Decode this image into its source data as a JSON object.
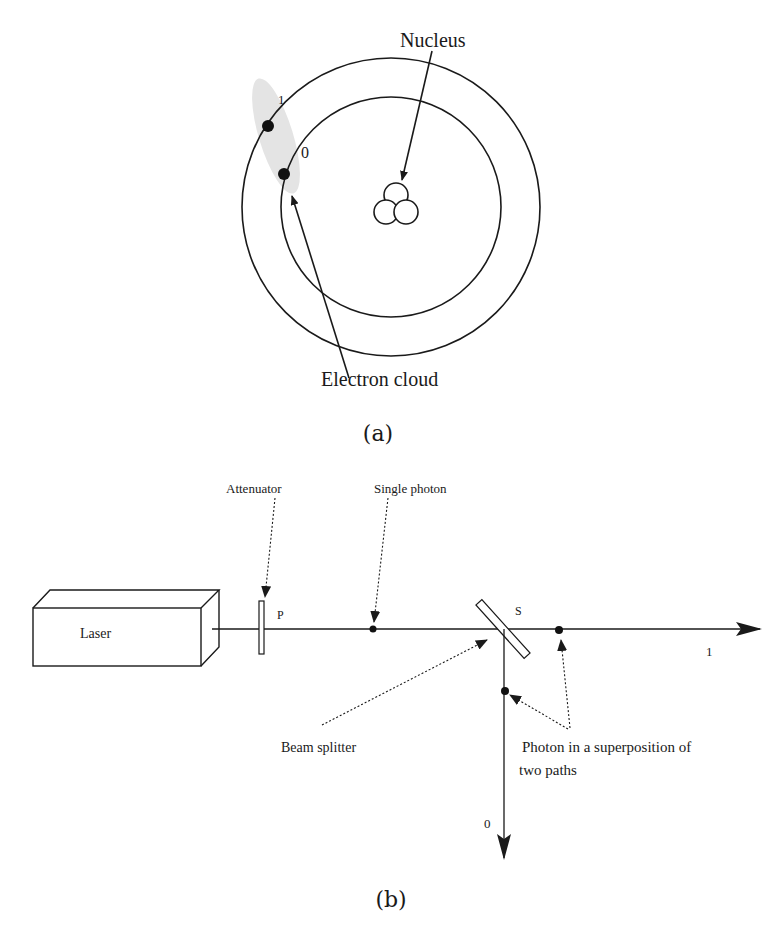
{
  "panel_a": {
    "label": "(a)",
    "nucleus_label": "Nucleus",
    "electron_cloud_label": "Electron cloud",
    "orbit_outer_label": "1",
    "orbit_inner_label": "0"
  },
  "panel_b": {
    "label": "(b)",
    "laser_label": "Laser",
    "attenuator_label": "Attenuator",
    "attenuator_symbol": "P",
    "single_photon_label": "Single photon",
    "beam_splitter_label": "Beam splitter",
    "beam_splitter_symbol": "S",
    "superposition_label_line1": "Photon in a superposition of",
    "superposition_label_line2": "two paths",
    "path_1_label": "1",
    "path_0_label": "0"
  },
  "colors": {
    "stroke": "#1a1a1a",
    "cloud": "#e4e4e4",
    "background": "#ffffff"
  }
}
